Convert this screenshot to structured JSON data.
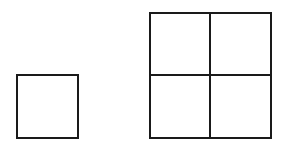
{
  "diagram": {
    "stroke_color": "#1a1a1a",
    "background_color": "#ffffff",
    "small_square": {
      "rows": 1,
      "cols": 1
    },
    "grid": {
      "rows": 2,
      "cols": 2
    }
  }
}
